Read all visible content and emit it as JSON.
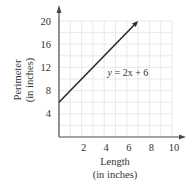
{
  "chart_data": {
    "type": "line",
    "title": "",
    "xlabel": "Length",
    "xlabel_sub": "(in inches)",
    "ylabel": "Perimeter",
    "ylabel_sub": "(in inches)",
    "xlim": [
      0,
      10
    ],
    "ylim": [
      0,
      20
    ],
    "x_ticks": [
      2,
      4,
      6,
      8,
      10
    ],
    "y_ticks": [
      4,
      8,
      12,
      16,
      20
    ],
    "grid": true,
    "grid_step_x": 1,
    "grid_step_y": 2,
    "series": [
      {
        "name": "y = 2x + 6",
        "equation": "y = 2x + 6",
        "slope": 2,
        "intercept": 6,
        "x": [
          0,
          7
        ],
        "y": [
          6,
          20
        ],
        "end_arrow": true
      }
    ],
    "annotations": [
      {
        "text_var": "y",
        "text_rest": " = 2x + 6",
        "x": 4.3,
        "y": 12
      }
    ],
    "colors": {
      "axis": "#4a4a4a",
      "line": "#2b2b2b",
      "grid": "#e4e4e4",
      "text": "#333333"
    }
  }
}
